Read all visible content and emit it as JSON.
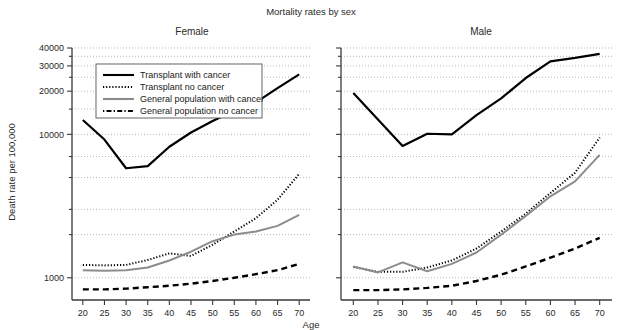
{
  "chart_data": {
    "type": "line",
    "title": "Mortality rates by sex",
    "xlabel": "Age",
    "ylabel": "Death rate per 100,000",
    "x": [
      20,
      25,
      30,
      35,
      40,
      45,
      50,
      55,
      60,
      65,
      70
    ],
    "xlim": [
      17.5,
      72.5
    ],
    "ylim": [
      700,
      40000
    ],
    "yscale": "log",
    "ytick_labels": [
      "1000",
      "10000",
      "20000",
      "30000",
      "40000"
    ],
    "ytick_values": [
      1000,
      10000,
      20000,
      30000,
      40000
    ],
    "minor_gridline_values": [
      2000,
      3000,
      5000,
      7000,
      15000,
      25000,
      35000
    ],
    "grid": true,
    "legend_position": "top-left-panel-1",
    "panels": [
      {
        "name": "Female",
        "series": [
          {
            "name": "Transplant with cancer",
            "style": "solid",
            "color": "#000000",
            "width": 2.2,
            "values": [
              12600,
              9200,
              5800,
              6000,
              8200,
              10300,
              12400,
              14600,
              16700,
              21000,
              26200
            ]
          },
          {
            "name": "Transplant no cancer",
            "style": "dotted",
            "color": "#000000",
            "width": 2.0,
            "values": [
              1230,
              1220,
              1230,
              1330,
              1480,
              1420,
              1700,
              2100,
              2600,
              3500,
              5300
            ]
          },
          {
            "name": "General population with cancer",
            "style": "solid",
            "color": "#8c8c8c",
            "width": 2.0,
            "values": [
              1130,
              1120,
              1130,
              1180,
              1320,
              1520,
              1800,
              2000,
              2100,
              2300,
              2750
            ]
          },
          {
            "name": "General population no cancer",
            "style": "dashed",
            "color": "#000000",
            "width": 2.4,
            "values": [
              830,
              830,
              840,
              860,
              880,
              910,
              950,
              1000,
              1060,
              1130,
              1250
            ]
          }
        ]
      },
      {
        "name": "Male",
        "series": [
          {
            "name": "Transplant with cancer",
            "style": "solid",
            "color": "#000000",
            "width": 2.2,
            "values": [
              19400,
              12700,
              8300,
              10100,
              10000,
              13600,
              17800,
              24700,
              32300,
              34100,
              36400
            ]
          },
          {
            "name": "Transplant no cancer",
            "style": "dotted",
            "color": "#000000",
            "width": 2.0,
            "values": [
              1190,
              1100,
              1100,
              1180,
              1320,
              1600,
              2100,
              2800,
              3900,
              5400,
              9500
            ]
          },
          {
            "name": "General population with cancer",
            "style": "solid",
            "color": "#8c8c8c",
            "width": 2.0,
            "values": [
              1200,
              1090,
              1280,
              1110,
              1250,
              1500,
              2000,
              2700,
              3700,
              4700,
              7200
            ]
          },
          {
            "name": "General population no cancer",
            "style": "dashed",
            "color": "#000000",
            "width": 2.4,
            "values": [
              820,
              820,
              830,
              850,
              880,
              950,
              1050,
              1200,
              1380,
              1600,
              1900
            ]
          }
        ]
      }
    ],
    "legend_entries": [
      {
        "label": "Transplant with cancer",
        "style": "solid",
        "color": "#000000"
      },
      {
        "label": "Transplant no cancer",
        "style": "dotted",
        "color": "#000000"
      },
      {
        "label": "General population with cancer",
        "style": "solid",
        "color": "#8c8c8c"
      },
      {
        "label": "General population no cancer",
        "style": "dashdash",
        "color": "#000000"
      }
    ]
  }
}
